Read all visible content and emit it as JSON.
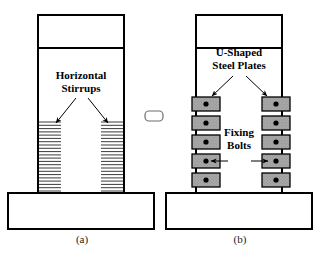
{
  "figure": {
    "background_color": "#ffffff",
    "line_color": "#000000",
    "plate_fill_color": "#a9a9a9",
    "stirrup_color": "#3a3a3a",
    "panels": [
      {
        "id": "panel-a",
        "caption": "(a)",
        "caption_x": 82,
        "caption_y": 240,
        "scheme": "horizontal-stirrups",
        "column": {
          "x": 38,
          "y": 15,
          "width": 86,
          "height": 178
        },
        "beam_divider_y": 48,
        "footing": {
          "x": 8,
          "y": 193,
          "width": 146,
          "height": 36
        },
        "annotation": {
          "name": "horizontal-stirrups-label",
          "line1": "Horizontal",
          "line2": "Stirrups",
          "center_x": 81,
          "line1_y": 76,
          "line2_y": 89,
          "arrows": [
            {
              "x1": 76,
              "y1": 98,
              "x2": 56,
              "y2": 123
            },
            {
              "x1": 88,
              "y1": 98,
              "x2": 108,
              "y2": 123
            }
          ]
        },
        "stirrups": {
          "count": 22,
          "top_y": 122,
          "bottom_y": 191,
          "left_group": {
            "x_start": 39,
            "x_end": 61
          },
          "right_group": {
            "x_start": 101,
            "x_end": 123
          }
        }
      },
      {
        "id": "panel-b",
        "caption": "(b)",
        "caption_x": 240,
        "caption_y": 240,
        "scheme": "u-shaped-steel-plates",
        "column": {
          "x": 196,
          "y": 15,
          "width": 86,
          "height": 178
        },
        "beam_divider_y": 48,
        "footing": {
          "x": 166,
          "y": 193,
          "width": 146,
          "height": 36
        },
        "plate_label": {
          "name": "u-shaped-steel-plates-label",
          "line1": "U-Shaped",
          "line2": "Steel Plates",
          "center_x": 239,
          "line1_y": 53,
          "line2_y": 66,
          "arrows": [
            {
              "x1": 233,
              "y1": 76,
              "x2": 212,
              "y2": 96
            },
            {
              "x1": 246,
              "y1": 76,
              "x2": 267,
              "y2": 96
            }
          ]
        },
        "bolts_label": {
          "name": "fixing-bolts-label",
          "line1": "Fixing",
          "line2": "Bolts",
          "center_x": 239,
          "line1_y": 133,
          "line2_y": 146,
          "arrows": [
            {
              "x1": 228,
              "y1": 155,
              "x2": 211,
              "y2": 155
            },
            {
              "x1": 251,
              "y1": 155,
              "x2": 268,
              "y2": 155
            }
          ]
        },
        "plates": {
          "count_per_side": 5,
          "plate_width": 28,
          "plate_height": 14,
          "gap": 5,
          "first_top_y": 97,
          "left_x": 192,
          "right_x": 262,
          "bolt_offset_x": 14,
          "bolt_offset_y": 7,
          "bolt_radius": 2.6
        }
      }
    ],
    "connector": {
      "name": "between-panels-connector",
      "x": 145,
      "y": 111,
      "width": 18,
      "height": 10,
      "rx": 4
    }
  }
}
